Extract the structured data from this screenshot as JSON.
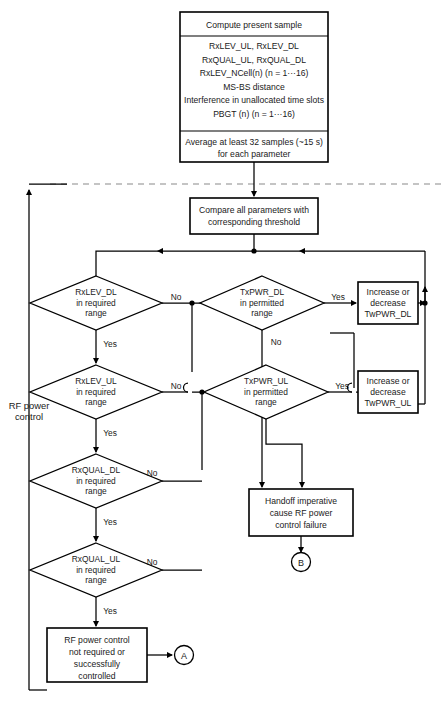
{
  "diagram": {
    "side_label": {
      "line1": "RF power",
      "line2": "control"
    },
    "nodes": {
      "compute": {
        "header": "Compute present sample",
        "params": [
          "RxLEV_UL, RxLEV_DL",
          "RxQUAL_UL, RxQUAL_DL",
          "RxLEV_NCell(n)   (n = 1···16)",
          "MS-BS distance",
          "Interference in unallocated time slots",
          "PBGT (n)       (n = 1···16)"
        ],
        "footer": [
          "Average at least 32 samples (~15 s)",
          "for each parameter"
        ]
      },
      "compare": {
        "lines": [
          "Compare all parameters with",
          "corresponding threshold"
        ]
      },
      "rxlev_dl": {
        "lines": [
          "RxLEV_DL",
          "in required",
          "range"
        ]
      },
      "rxlev_ul": {
        "lines": [
          "RxLEV_UL",
          "in required",
          "range"
        ]
      },
      "rxqual_dl": {
        "lines": [
          "RxQUAL_DL",
          "in required",
          "range"
        ]
      },
      "rxqual_ul": {
        "lines": [
          "RxQUAL_UL",
          "in required",
          "range"
        ]
      },
      "txpwr_dl": {
        "lines": [
          "TxPWR_DL",
          "in permitted",
          "range"
        ]
      },
      "txpwr_ul": {
        "lines": [
          "TxPWR_UL",
          "in permitted",
          "range"
        ]
      },
      "inc_dec_dl": {
        "lines": [
          "Increase or",
          "decrease",
          "TwPWR_DL"
        ]
      },
      "inc_dec_ul": {
        "lines": [
          "Increase or",
          "decrease",
          "TwPWR_UL"
        ]
      },
      "handoff": {
        "lines": [
          "Handoff imperative",
          "cause RF power",
          "control failure"
        ]
      },
      "ok": {
        "lines": [
          "RF power control",
          "not required or",
          "successfully",
          "controlled"
        ]
      },
      "connector_a": {
        "label": "A"
      },
      "connector_b": {
        "label": "B"
      }
    },
    "edge_labels": {
      "rxlev_dl_no": "No",
      "rxlev_dl_yes": "Yes",
      "rxlev_ul_no": "No",
      "rxlev_ul_yes": "Yes",
      "rxqual_dl_no": "No",
      "rxqual_dl_yes": "Yes",
      "rxqual_ul_no": "No",
      "rxqual_ul_yes": "Yes",
      "txpwr_dl_yes": "Yes",
      "txpwr_dl_no": "No",
      "txpwr_ul_yes": "Yes",
      "txpwr_ul_no": "No"
    },
    "colors": {
      "stroke": "#000000",
      "text": "#1a1a1a",
      "dashed_divider": "#8a8a8a",
      "background": "#ffffff"
    }
  }
}
